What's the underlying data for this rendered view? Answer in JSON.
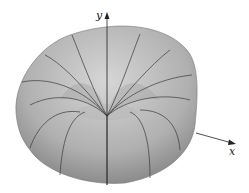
{
  "figure": {
    "axes": {
      "y_label": "y",
      "x_label": "x"
    },
    "colors": {
      "surface_light": "#c8c8c8",
      "surface_dark": "#8a8a8a",
      "lines": "#3a3a3a"
    }
  }
}
